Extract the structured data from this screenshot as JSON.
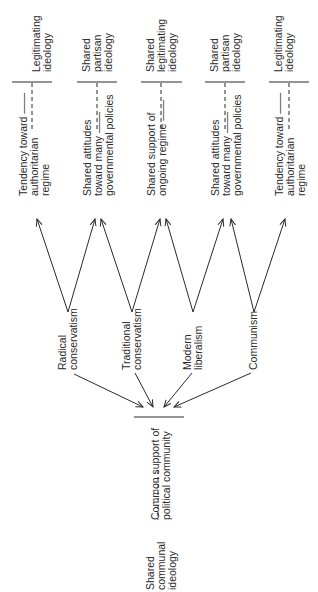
{
  "diagram": {
    "orientation": "rotated-90-ccw",
    "top_row": [
      {
        "upper": [
          "Legitimating",
          "ideology"
        ],
        "lower": [
          "Tendency toward ——",
          "authoritarian",
          "regime"
        ]
      },
      {
        "upper": [
          "Shared",
          "partisan",
          "ideology"
        ],
        "lower": [
          "Shared attitudes",
          "toward many ——",
          "governmental policies"
        ]
      },
      {
        "upper": [
          "Shared",
          "legitimating",
          "ideology"
        ],
        "lower": [
          "Shared support of",
          "ongoing regime ——"
        ]
      },
      {
        "upper": [
          "Shared",
          "partisan",
          "ideology"
        ],
        "lower": [
          "Shared attitudes",
          "toward many ——",
          "governmental policies"
        ]
      },
      {
        "upper": [
          "Legitimating",
          "ideology"
        ],
        "lower": [
          "Tendency toward ——",
          "authoritarian",
          "regime"
        ]
      }
    ],
    "ideologies": [
      {
        "lines": [
          "Radical",
          "conservatism"
        ]
      },
      {
        "lines": [
          "Traditional",
          "conservatism"
        ]
      },
      {
        "lines": [
          "Modern",
          "liberalism"
        ]
      },
      {
        "lines": [
          "Communism"
        ]
      }
    ],
    "bottom": {
      "left": [
        "Shared",
        "communal",
        "ideology"
      ],
      "right": [
        "Common support of",
        "political community"
      ]
    },
    "line_color": "#2a2a2a"
  }
}
